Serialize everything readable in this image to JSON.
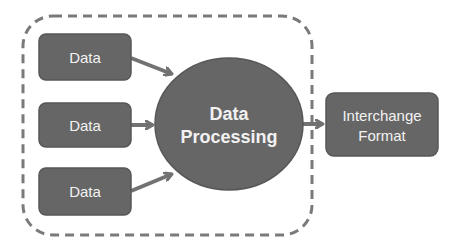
{
  "diagram": {
    "colors": {
      "node_fill": "#666666",
      "node_stroke": "#575757",
      "arrow": "#727272",
      "boundary": "#7a7a7a",
      "text": "#f2f2f2",
      "background": "#ffffff"
    },
    "boundary": {
      "style": "dashed-rounded-rect"
    },
    "inputs": [
      {
        "label": "Data"
      },
      {
        "label": "Data"
      },
      {
        "label": "Data"
      }
    ],
    "processor": {
      "line1": "Data",
      "line2": "Processing",
      "shape": "ellipse"
    },
    "output": {
      "line1": "Interchange",
      "line2": "Format"
    },
    "edges": [
      {
        "from": "Data (top)",
        "to": "Data Processing"
      },
      {
        "from": "Data (middle)",
        "to": "Data Processing"
      },
      {
        "from": "Data (bottom)",
        "to": "Data Processing"
      },
      {
        "from": "Data Processing",
        "to": "Interchange Format"
      }
    ]
  }
}
